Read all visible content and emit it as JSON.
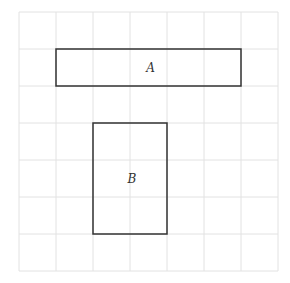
{
  "diagram": {
    "grid": {
      "cols": 7,
      "rows": 7,
      "cell_size": 37,
      "origin_x": 19,
      "origin_y": 12,
      "line_color": "#e2e2e2"
    },
    "shapes": [
      {
        "label": "A",
        "col": 1,
        "row": 1,
        "width_cells": 5,
        "height_cells": 1
      },
      {
        "label": "B",
        "col": 2,
        "row": 3,
        "width_cells": 2,
        "height_cells": 3
      }
    ],
    "stroke_color": "#333333"
  }
}
